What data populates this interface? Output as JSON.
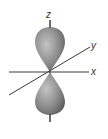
{
  "diagram": {
    "axes": {
      "z": {
        "label": "z"
      },
      "y": {
        "label": "y"
      },
      "x": {
        "label": "x"
      }
    },
    "lobes": [
      "upper lobe",
      "lower lobe"
    ],
    "colors": {
      "lobe_light": "#b8b8b8",
      "lobe_dark": "#6e6e6e",
      "axis": "#3a3a3a",
      "background": "#ffffff"
    },
    "caption": ""
  }
}
